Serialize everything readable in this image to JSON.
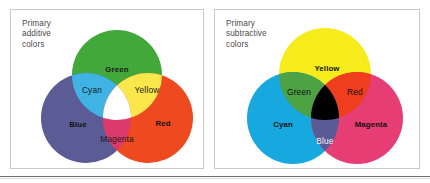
{
  "figure": {
    "panels": [
      {
        "id": "additive",
        "caption": "Primary\nadditive\ncolors",
        "model": "RGB",
        "primaries": [
          {
            "name": "Green",
            "label": "Green",
            "color": "#43A83A",
            "text_color": "#1a1a1a",
            "weight": "bold"
          },
          {
            "name": "Blue",
            "label": "Blue",
            "color": "#5B5B96",
            "text_color": "#111111",
            "weight": "bold"
          },
          {
            "name": "Red",
            "label": "Red",
            "color": "#EF4A1F",
            "text_color": "#111111",
            "weight": "bold"
          }
        ],
        "overlaps": [
          {
            "name": "Cyan",
            "label": "Cyan",
            "color": "#3FB4E4",
            "text_color": "#1a1a1a",
            "weight": "plain"
          },
          {
            "name": "Yellow",
            "label": "Yellow",
            "color": "#F9E74B",
            "text_color": "#1a1a1a",
            "weight": "plain"
          },
          {
            "name": "Magenta",
            "label": "Magenta",
            "color": "#DC3A6E",
            "text_color": "#1a1a1a",
            "weight": "plain"
          }
        ],
        "center": {
          "name": "White",
          "label": "",
          "color": "#FFFFFF"
        }
      },
      {
        "id": "subtractive",
        "caption": "Primary\nsubtractive\ncolors",
        "model": "CMY",
        "primaries": [
          {
            "name": "Yellow",
            "label": "Yellow",
            "color": "#F6EC1C",
            "text_color": "#111111",
            "weight": "bold"
          },
          {
            "name": "Cyan",
            "label": "Cyan",
            "color": "#18A8E0",
            "text_color": "#111111",
            "weight": "bold"
          },
          {
            "name": "Magenta",
            "label": "Magenta",
            "color": "#E73D75",
            "text_color": "#111111",
            "weight": "bold"
          }
        ],
        "overlaps": [
          {
            "name": "Green",
            "label": "Green",
            "color": "#4DA244",
            "text_color": "#111111",
            "weight": "plain"
          },
          {
            "name": "Red",
            "label": "Red",
            "color": "#EE3E1E",
            "text_color": "#111111",
            "weight": "plain"
          },
          {
            "name": "Blue",
            "label": "Blue",
            "color": "#5A5B95",
            "text_color": "#f2f2f2",
            "weight": "plain"
          }
        ],
        "center": {
          "name": "Black",
          "label": "",
          "color": "#000000"
        }
      }
    ],
    "border_color": "#c9c9c9",
    "rule_color": "#6f6f6f",
    "background": "#ffffff"
  }
}
